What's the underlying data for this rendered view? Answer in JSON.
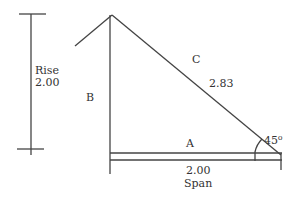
{
  "diagram": {
    "type": "right-triangle-roof-pitch",
    "labels": {
      "rise_title": "Rise",
      "rise_value": "2.00",
      "side_b": "B",
      "side_c": "C",
      "hypotenuse_value": "2.83",
      "side_a": "A",
      "span_value": "2.00",
      "span_title": "Span",
      "angle": "45⁰"
    },
    "colors": {
      "line": "#444444",
      "text": "#333333",
      "background": "#ffffff"
    }
  }
}
